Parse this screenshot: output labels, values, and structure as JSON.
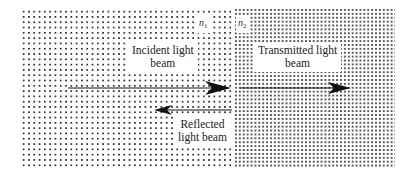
{
  "diagram": {
    "media": [
      {
        "id": "medium-1",
        "index_symbol": "n",
        "index_subscript": "1",
        "pattern": "coarse-dots"
      },
      {
        "id": "medium-2",
        "index_symbol": "n",
        "index_subscript": "2",
        "pattern": "fine-dots"
      }
    ],
    "labels": {
      "incident": {
        "line1": "Incident light",
        "line2": "beam"
      },
      "transmitted": {
        "line1": "Transmitted light",
        "line2": "beam"
      },
      "reflected": {
        "line1": "Reflected",
        "line2": "light beam"
      }
    },
    "arrows": [
      {
        "name": "incident-beam",
        "direction": "right",
        "medium": "n1"
      },
      {
        "name": "transmitted-beam",
        "direction": "right",
        "medium": "n2"
      },
      {
        "name": "reflected-beam",
        "direction": "left",
        "medium": "n1"
      }
    ],
    "colors": {
      "background": "#ffffff",
      "dots_medium_1": "#3a3a3a",
      "dots_medium_2": "#5a5a5a",
      "arrow": "#111111",
      "text": "#222222"
    }
  }
}
